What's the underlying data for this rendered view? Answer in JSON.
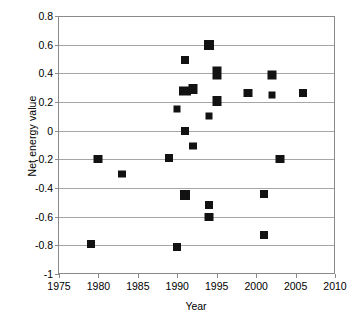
{
  "chart_data": {
    "type": "scatter",
    "title": "",
    "xlabel": "Year",
    "ylabel": "Net energy value",
    "xlim": [
      1975,
      2010
    ],
    "ylim": [
      -1,
      0.8
    ],
    "xticks": [
      1975,
      1980,
      1985,
      1990,
      1995,
      2000,
      2005,
      2010
    ],
    "xtick_labels": [
      "1975",
      "1980",
      "1985",
      "1990",
      "1995",
      "2000",
      "2005",
      "2010"
    ],
    "yticks": [
      0.8,
      0.6,
      0.4,
      0.2,
      0,
      -0.2,
      -0.4,
      -0.6,
      -0.8,
      -1
    ],
    "ytick_labels": [
      "0.8",
      "0.6",
      "0.4",
      "0.2",
      "0",
      "-0.2",
      "-0.4",
      "-0.6",
      "-0.8",
      "-1"
    ],
    "grid": "horizontal",
    "legend": null,
    "marker": "filled-square",
    "marker_color": "#121212",
    "points": [
      {
        "x": 1979,
        "y": -0.79,
        "w": 8,
        "h": 8
      },
      {
        "x": 1980,
        "y": -0.2,
        "w": 9,
        "h": 8
      },
      {
        "x": 1983,
        "y": -0.3,
        "w": 8,
        "h": 7
      },
      {
        "x": 1989,
        "y": -0.19,
        "w": 8,
        "h": 8
      },
      {
        "x": 1990,
        "y": -0.81,
        "w": 8,
        "h": 8
      },
      {
        "x": 1990,
        "y": 0.15,
        "w": 7,
        "h": 7
      },
      {
        "x": 1991,
        "y": 0.49,
        "w": 8,
        "h": 8
      },
      {
        "x": 1991,
        "y": 0.28,
        "w": 12,
        "h": 9
      },
      {
        "x": 1992,
        "y": 0.29,
        "w": 9,
        "h": 10
      },
      {
        "x": 1991,
        "y": 0.0,
        "w": 8,
        "h": 8
      },
      {
        "x": 1991,
        "y": -0.45,
        "w": 10,
        "h": 10
      },
      {
        "x": 1992,
        "y": -0.11,
        "w": 8,
        "h": 7
      },
      {
        "x": 1994,
        "y": 0.6,
        "w": 10,
        "h": 10
      },
      {
        "x": 1994,
        "y": 0.1,
        "w": 7,
        "h": 7
      },
      {
        "x": 1994,
        "y": -0.52,
        "w": 8,
        "h": 8
      },
      {
        "x": 1994,
        "y": -0.6,
        "w": 9,
        "h": 8
      },
      {
        "x": 1995,
        "y": 0.4,
        "w": 9,
        "h": 13
      },
      {
        "x": 1995,
        "y": 0.21,
        "w": 9,
        "h": 10
      },
      {
        "x": 1999,
        "y": 0.26,
        "w": 9,
        "h": 8
      },
      {
        "x": 2001,
        "y": -0.44,
        "w": 8,
        "h": 8
      },
      {
        "x": 2001,
        "y": -0.73,
        "w": 8,
        "h": 8
      },
      {
        "x": 2002,
        "y": 0.39,
        "w": 9,
        "h": 9
      },
      {
        "x": 2002,
        "y": 0.25,
        "w": 7,
        "h": 7
      },
      {
        "x": 2003,
        "y": -0.2,
        "w": 9,
        "h": 8
      },
      {
        "x": 2006,
        "y": 0.26,
        "w": 8,
        "h": 8
      }
    ]
  }
}
